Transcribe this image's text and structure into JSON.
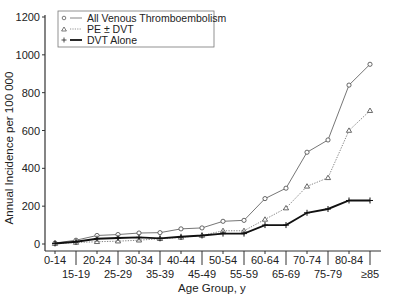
{
  "chart_data": {
    "type": "line",
    "title": "",
    "xlabel": "Age Group, y",
    "ylabel": "Annual Incidence per 100 000",
    "ylim": [
      0,
      1200
    ],
    "yticks": [
      0,
      200,
      400,
      600,
      800,
      1000,
      1200
    ],
    "grid": false,
    "legend_position": "upper left",
    "categories": [
      "0-14",
      "15-19",
      "20-24",
      "25-29",
      "30-34",
      "35-39",
      "40-44",
      "45-49",
      "50-54",
      "55-59",
      "60-64",
      "65-69",
      "70-74",
      "75-79",
      "80-84",
      "≥85"
    ],
    "series": [
      {
        "name": "All Venous Thromboembolism",
        "marker": "circle",
        "line": "solid-thin",
        "values": [
          5,
          20,
          45,
          50,
          58,
          60,
          80,
          85,
          120,
          125,
          240,
          295,
          485,
          550,
          840,
          950
        ]
      },
      {
        "name": "PE ± DVT",
        "marker": "triangle",
        "line": "dotted",
        "values": [
          2,
          8,
          12,
          15,
          20,
          28,
          35,
          45,
          70,
          70,
          130,
          190,
          305,
          350,
          600,
          705
        ]
      },
      {
        "name": "DVT Alone",
        "marker": "plus",
        "line": "solid-thick",
        "values": [
          3,
          12,
          28,
          32,
          35,
          30,
          38,
          45,
          55,
          55,
          100,
          100,
          165,
          185,
          230,
          230
        ]
      }
    ]
  }
}
